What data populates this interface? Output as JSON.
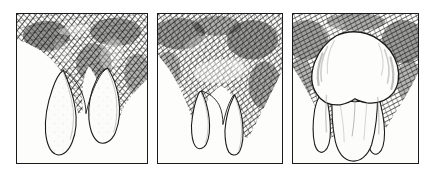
{
  "figure": {
    "title": "Stages of tooth eruption through the gum",
    "medium": "line engraving / cross-hatched pen-and-ink",
    "background_color": "#ffffff",
    "paper_color": "#fdfdfb",
    "ink_color": "#1a1a1a",
    "panel_count": 3,
    "caption": ""
  },
  "panels": [
    {
      "id": "panel-1",
      "label": "Stage 1",
      "description": "Two pointed tooth cusps mostly covered by densely hatched gum tissue; only the lower tips of the crown emerge.",
      "tooth_state": "largely-submerged",
      "cusps_visible": 2,
      "shading_density": "heavy",
      "x": 16,
      "y": 13,
      "width": 132,
      "height": 151
    },
    {
      "id": "panel-2",
      "label": "Stage 2",
      "description": "Gum tissue recedes slightly; two narrow cusp tips project below a broad hatched gum mass, with the gum margin arching between them.",
      "tooth_state": "partially-erupted",
      "cusps_visible": 2,
      "shading_density": "heavy",
      "x": 157,
      "y": 13,
      "width": 126,
      "height": 151
    },
    {
      "id": "panel-3",
      "label": "Stage 3",
      "description": "The full bulbous crown of the tooth is exposed, pale and highlighted, with two tapering roots or cusps below; hatched gum tissue remains only at the sides and top corners.",
      "tooth_state": "fully-erupted",
      "cusps_visible": 2,
      "shading_density": "moderate",
      "x": 292,
      "y": 13,
      "width": 127,
      "height": 151
    }
  ],
  "colors": {
    "ink": "#1a1a1a",
    "hatch_dark": "#2b2b2b",
    "hatch_mid": "#555555",
    "hatch_light": "#8a8a8a",
    "paper": "#fdfdfb",
    "page": "#ffffff"
  }
}
